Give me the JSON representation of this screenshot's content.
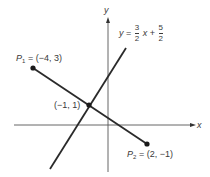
{
  "diagram": {
    "axes": {
      "x_label": "x",
      "y_label": "y"
    },
    "line_equation": {
      "lhs": "y",
      "equals": "=",
      "frac1_num": "3",
      "frac1_den": "2",
      "var": "x",
      "plus": "+",
      "frac2_num": "5",
      "frac2_den": "2"
    },
    "points": {
      "p1": {
        "name": "P",
        "sub": "1",
        "coords": "= (−4, 3)"
      },
      "intersection": {
        "coords": "(−1, 1)"
      },
      "p2": {
        "name": "P",
        "sub": "2",
        "coords": "= (2, −1)"
      }
    },
    "colors": {
      "line": "#2a2a2a",
      "axis": "#555555",
      "background": "#ffffff"
    }
  }
}
